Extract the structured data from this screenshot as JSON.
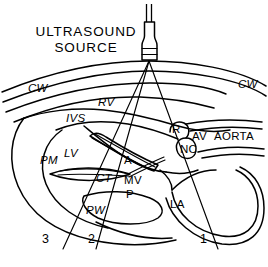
{
  "figure": {
    "type": "medical-diagram",
    "background_color": "#ffffff",
    "line_color": "#000000"
  },
  "title": {
    "line1": "ULTRASOUND",
    "line2": "SOURCE"
  },
  "probe": {
    "name": "ultrasound-transducer",
    "band_count": 2
  },
  "labels": {
    "chest_wall_left": "CW",
    "chest_wall_right": "CW",
    "right_ventricle": "RV",
    "interventricular_septum": "IVS",
    "left_ventricle": "LV",
    "papillary_muscle": "PM",
    "chordae_tendineae": "CT",
    "posterior_wall": "PW",
    "anterior_leaflet": "A",
    "mitral_valve": "MV",
    "posterior_leaflet": "P",
    "left_atrium": "LA",
    "right_cusp": "R",
    "noncoronary_cusp": "NC",
    "aortic_valve": "AV",
    "aorta": "AORTA"
  },
  "beams": [
    {
      "id": "1",
      "label": "1"
    },
    {
      "id": "2",
      "label": "2"
    },
    {
      "id": "3",
      "label": "3"
    }
  ]
}
